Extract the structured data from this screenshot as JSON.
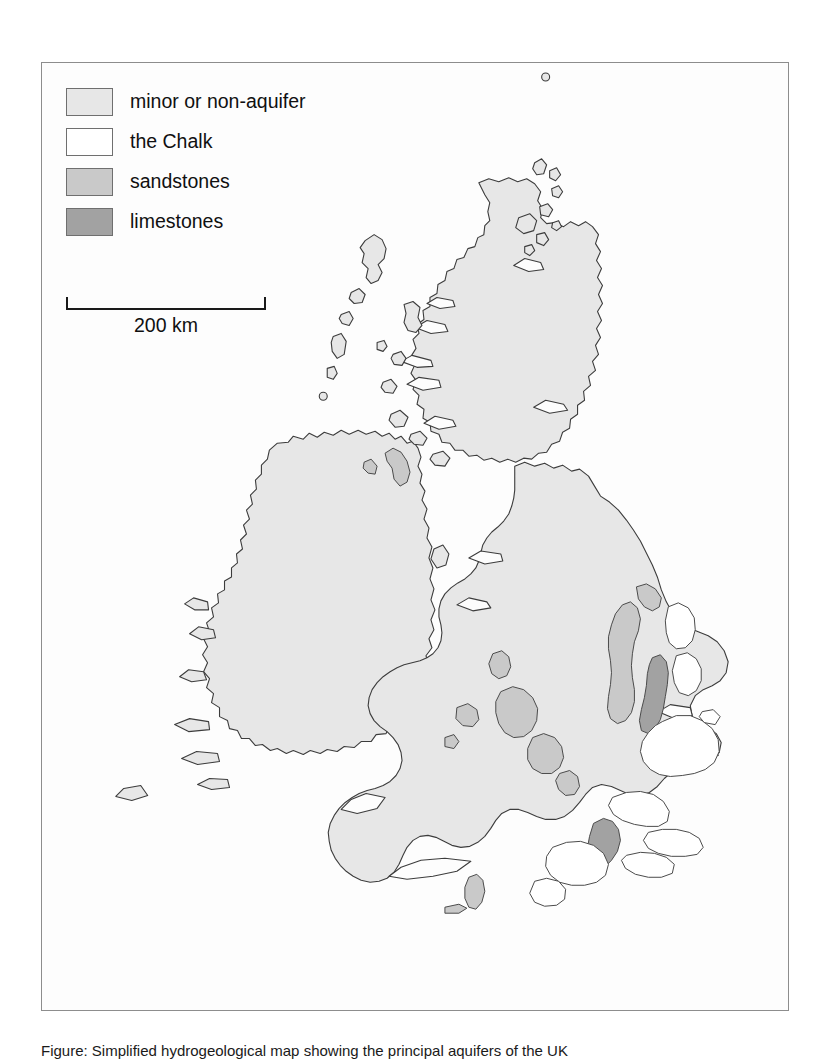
{
  "figure": {
    "caption": "Figure: Simplified hydrogeological map showing the principal aquifers of the UK"
  },
  "legend": {
    "items": [
      {
        "label": "minor or non-aquifer",
        "color": "#e7e7e7",
        "swatch_name": "swatch-minor-or-non-aquifer"
      },
      {
        "label": "the Chalk",
        "color": "#ffffff",
        "swatch_name": "swatch-the-chalk"
      },
      {
        "label": "sandstones",
        "color": "#c9c9c9",
        "swatch_name": "swatch-sandstones"
      },
      {
        "label": "limestones",
        "color": "#a2a2a2",
        "swatch_name": "swatch-limestones"
      }
    ]
  },
  "scale": {
    "label": "200 km",
    "length_km": 200
  },
  "map": {
    "title": "UK and Ireland aquifer map",
    "sea_color": "#fdfdfd",
    "coast_stroke": "#3c3c3c",
    "regions": [
      {
        "name": "ireland",
        "class": "minor or non-aquifer"
      },
      {
        "name": "scotland-mainland",
        "class": "minor or non-aquifer"
      },
      {
        "name": "outer-hebrides",
        "class": "minor or non-aquifer"
      },
      {
        "name": "inner-hebrides",
        "class": "minor or non-aquifer"
      },
      {
        "name": "orkney",
        "class": "minor or non-aquifer"
      },
      {
        "name": "shetland",
        "class": "minor or non-aquifer"
      },
      {
        "name": "isle-of-man",
        "class": "minor or non-aquifer"
      },
      {
        "name": "wales",
        "class": "minor or non-aquifer"
      },
      {
        "name": "england",
        "class": "minor or non-aquifer"
      },
      {
        "name": "permo-triassic-sandstone-vale-of-york",
        "class": "sandstones"
      },
      {
        "name": "permo-triassic-sandstone-cheshire",
        "class": "sandstones"
      },
      {
        "name": "permo-triassic-sandstone-midlands",
        "class": "sandstones"
      },
      {
        "name": "permo-triassic-sandstone-devon",
        "class": "sandstones"
      },
      {
        "name": "magnesian-limestone-durham",
        "class": "limestones"
      },
      {
        "name": "jurassic-limestone-lincolnshire",
        "class": "limestones"
      },
      {
        "name": "jurassic-limestone-cotswolds",
        "class": "limestones"
      },
      {
        "name": "chalk-yorkshire-wolds",
        "class": "the Chalk"
      },
      {
        "name": "chalk-lincolnshire-wolds",
        "class": "the Chalk"
      },
      {
        "name": "chalk-east-anglia",
        "class": "the Chalk"
      },
      {
        "name": "chalk-chilterns",
        "class": "the Chalk"
      },
      {
        "name": "chalk-north-downs",
        "class": "the Chalk"
      },
      {
        "name": "chalk-south-downs",
        "class": "the Chalk"
      },
      {
        "name": "chalk-salisbury-plain",
        "class": "the Chalk"
      },
      {
        "name": "chalk-dorset",
        "class": "the Chalk"
      }
    ]
  }
}
